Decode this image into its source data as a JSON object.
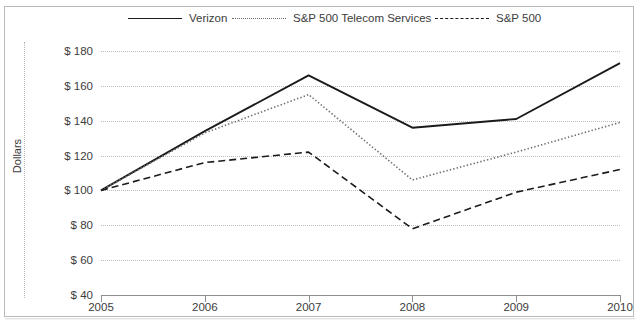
{
  "chart_data": {
    "type": "line",
    "title": "",
    "xlabel": "",
    "ylabel": "Dollars",
    "x": [
      2005,
      2006,
      2007,
      2008,
      2009,
      2010
    ],
    "categories": [
      "2005",
      "2006",
      "2007",
      "2008",
      "2009",
      "2010"
    ],
    "ylim": [
      40,
      180
    ],
    "ytick_values": [
      40,
      60,
      80,
      100,
      120,
      140,
      160,
      180
    ],
    "ytick_labels": [
      "$ 40",
      "$ 60",
      "$ 80",
      "$ 100",
      "$ 120",
      "$ 140",
      "$ 160",
      "$ 180"
    ],
    "grid": true,
    "legend_position": "top",
    "series": [
      {
        "name": "Verizon",
        "style": "solid",
        "color": "#1b1b1b",
        "values": [
          100,
          134,
          166,
          136,
          141,
          173
        ]
      },
      {
        "name": "S&P 500 Telecom Services",
        "style": "dotted",
        "color": "#6f6f6f",
        "values": [
          100,
          133,
          155,
          106,
          122,
          139
        ]
      },
      {
        "name": "S&P 500",
        "style": "dashed",
        "color": "#1b1b1b",
        "values": [
          100,
          116,
          122,
          78,
          99,
          112
        ]
      }
    ]
  },
  "legend": {
    "items": [
      {
        "label": "Verizon",
        "style": "solid"
      },
      {
        "label": "S&P 500 Telecom Services",
        "style": "dotted"
      },
      {
        "label": "S&P 500",
        "style": "dashed"
      }
    ]
  },
  "axes": {
    "y_title": "Dollars"
  }
}
